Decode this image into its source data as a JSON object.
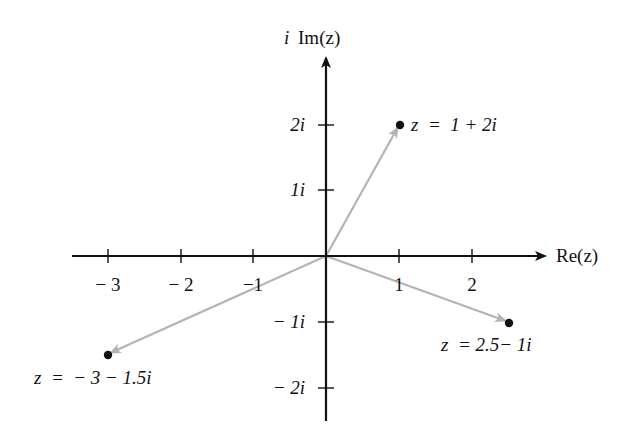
{
  "diagram": {
    "axes": {
      "x_label": "Re(z)",
      "y_label_prefix": "i",
      "y_label": "Im(z)",
      "x_ticks": [
        {
          "value": -3,
          "label": "− 3"
        },
        {
          "value": -2,
          "label": "− 2"
        },
        {
          "value": -1,
          "label": "−1"
        },
        {
          "value": 1,
          "label": "1"
        },
        {
          "value": 2,
          "label": "2"
        }
      ],
      "y_ticks": [
        {
          "value": 2,
          "label": "2i"
        },
        {
          "value": 1,
          "label": "1i"
        },
        {
          "value": -1,
          "label": "− 1i"
        },
        {
          "value": -2,
          "label": "− 2i"
        }
      ]
    },
    "points": [
      {
        "re": 1,
        "im": 2,
        "label": "z  =  1 + 2i"
      },
      {
        "re": 2.5,
        "im": -1,
        "label": "z  = 2.5− 1i"
      },
      {
        "re": -3,
        "im": -1.5,
        "label": "z  =  − 3 − 1.5i"
      }
    ],
    "colors": {
      "axis": "#111111",
      "vector": "#b4b4b4",
      "point": "#111111"
    }
  }
}
